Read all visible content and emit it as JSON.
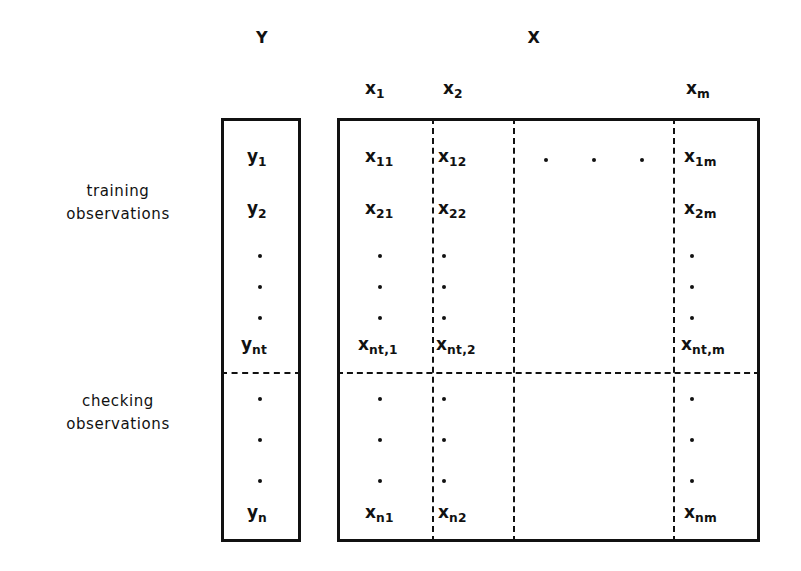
{
  "figure": {
    "background_color": "#ffffff",
    "ink_color": "#111111"
  },
  "headers": {
    "response_group_label": "Y",
    "predictor_group_label": "X",
    "columns": [
      {
        "base": "x",
        "sub": "1"
      },
      {
        "base": "x",
        "sub": "2"
      },
      {
        "base": "x",
        "sub": "m"
      }
    ]
  },
  "row_groups": [
    {
      "id": "training",
      "line1": "training",
      "line2": "observations"
    },
    {
      "id": "checking",
      "line1": "checking",
      "line2": "observations"
    }
  ],
  "y_column": {
    "entries": [
      {
        "base": "y",
        "sub": "1"
      },
      {
        "base": "y",
        "sub": "2"
      },
      {
        "base": "y",
        "sub": "nt"
      },
      {
        "base": "y",
        "sub": "n"
      }
    ]
  },
  "x_matrix": {
    "training_rows": [
      {
        "c1": {
          "base": "x",
          "sub": "11"
        },
        "c2": {
          "base": "x",
          "sub": "12"
        },
        "cm": {
          "base": "x",
          "sub": "1m"
        }
      },
      {
        "c1": {
          "base": "x",
          "sub": "21"
        },
        "c2": {
          "base": "x",
          "sub": "22"
        },
        "cm": {
          "base": "x",
          "sub": "2m"
        }
      },
      {
        "c1": {
          "base": "x",
          "sub": "nt,1"
        },
        "c2": {
          "base": "x",
          "sub": "nt,2"
        },
        "cm": {
          "base": "x",
          "sub": "nt,m"
        }
      }
    ],
    "checking_rows": [
      {
        "c1": {
          "base": "x",
          "sub": "n1"
        },
        "c2": {
          "base": "x",
          "sub": "n2"
        },
        "cm": {
          "base": "x",
          "sub": "nm"
        }
      }
    ]
  },
  "ellipses": {
    "horizontal_dots_count": 3,
    "vertical_dots_count": 3
  }
}
